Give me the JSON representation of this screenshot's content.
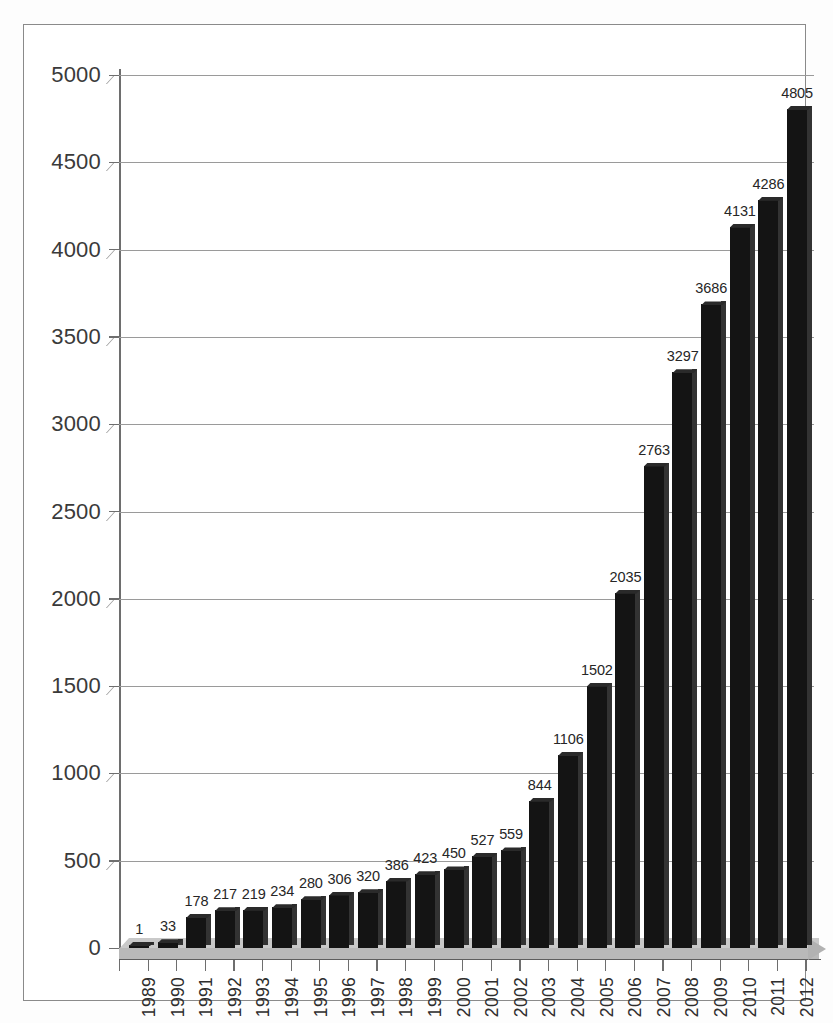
{
  "chart_data": {
    "type": "bar",
    "title": "",
    "subtitle": "",
    "xlabel": "",
    "ylabel": "",
    "categories": [
      "1989",
      "1990",
      "1991",
      "1992",
      "1993",
      "1994",
      "1995",
      "1996",
      "1997",
      "1998",
      "1999",
      "2000",
      "2001",
      "2002",
      "2003",
      "2004",
      "2005",
      "2006",
      "2007",
      "2008",
      "2009",
      "2010",
      "2011",
      "2012"
    ],
    "values": [
      1,
      33,
      178,
      217,
      219,
      234,
      280,
      306,
      320,
      386,
      423,
      450,
      527,
      559,
      844,
      1106,
      1502,
      2035,
      2763,
      3297,
      3686,
      4131,
      4286,
      4805
    ],
    "data_labels": [
      "1",
      "33",
      "178",
      "217",
      "219",
      "234",
      "280",
      "306",
      "320",
      "386",
      "423",
      "450",
      "527",
      "559",
      "844",
      "1106",
      "1502",
      "2035",
      "2763",
      "3297",
      "3686",
      "4131",
      "4286",
      "4805"
    ],
    "ylim": [
      0,
      5000
    ],
    "ytick_labels": [
      "0",
      "500",
      "1000",
      "1500",
      "2000",
      "2500",
      "3000",
      "3500",
      "4000",
      "4500",
      "5000"
    ],
    "ytick_values": [
      0,
      500,
      1000,
      1500,
      2000,
      2500,
      3000,
      3500,
      4000,
      4500,
      5000
    ],
    "grid": true,
    "legend": "none",
    "legend_position": "none",
    "style": "3d-column",
    "bar_color": "#141414",
    "gridline_color": "#9a9a9a",
    "axis_color": "#6e6e6e",
    "floor_color": "#b9b9b9",
    "background_color": "#ffffff",
    "label_color": "#262626"
  }
}
